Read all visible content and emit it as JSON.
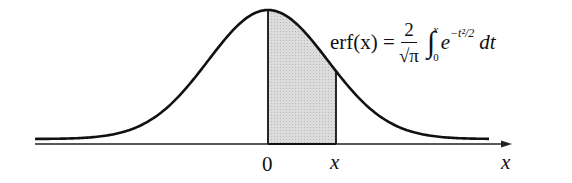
{
  "figure": {
    "formula": {
      "lhs": "erf(x) =",
      "numerator": "2",
      "denominator": "√π",
      "integral": "∫",
      "upper_limit": "x",
      "lower_limit": "0",
      "integrand_base": "e",
      "integrand_exponent": "−t²/2",
      "differential": "dt"
    },
    "axis_labels": {
      "origin": "0",
      "upper_bound": "x",
      "axis_name": "x"
    },
    "colors": {
      "curve": "#111111",
      "shade": "#d6d6d6",
      "axis": "#222222"
    }
  }
}
